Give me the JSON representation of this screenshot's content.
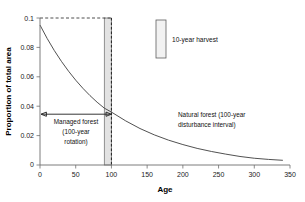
{
  "chart_data": {
    "type": "line",
    "title": "",
    "xlabel": "Age",
    "ylabel": "Proportion of total area",
    "xlim": [
      0,
      350
    ],
    "ylim": [
      0,
      0.1
    ],
    "grid": false,
    "x_ticks": [
      0,
      50,
      100,
      150,
      200,
      250,
      300,
      350
    ],
    "x_tick_labels": [
      "0",
      "50",
      "100",
      "150",
      "200",
      "250",
      "300",
      "350"
    ],
    "y_ticks": [
      0,
      0.02,
      0.04,
      0.06,
      0.08,
      0.1
    ],
    "y_tick_labels": [
      "0",
      "0.02",
      "0.04",
      "0.06",
      "0.08",
      "0.1"
    ],
    "series": [
      {
        "name": "Natural forest (100-year disturbance interval)",
        "type": "line",
        "x": [
          0,
          10,
          20,
          30,
          40,
          50,
          60,
          70,
          80,
          90,
          100,
          120,
          140,
          160,
          180,
          200,
          220,
          240,
          260,
          280,
          300,
          320,
          340
        ],
        "values": [
          0.0952,
          0.0861,
          0.0779,
          0.0705,
          0.0638,
          0.0577,
          0.0522,
          0.0472,
          0.0427,
          0.0387,
          0.036,
          0.03,
          0.0248,
          0.0205,
          0.0169,
          0.0139,
          0.0113,
          0.0092,
          0.0074,
          0.0058,
          0.0046,
          0.0038,
          0.0032
        ]
      },
      {
        "name": "Managed forest full-stocking reference",
        "type": "dashed-horizontal",
        "y": 0.1,
        "x_start": 0,
        "x_end": 100
      },
      {
        "name": "Rotation age marker",
        "type": "dashed-vertical",
        "x": 100,
        "y_start": 0,
        "y_end": 0.1
      }
    ],
    "shaded_regions": [
      {
        "name": "10-year harvest band",
        "x_start": 90,
        "x_end": 100,
        "y_start": 0,
        "y_end": 0.1,
        "fill": "#e2e2e2"
      }
    ],
    "annotations": [
      {
        "name": "managed-forest-span",
        "type": "double-arrow",
        "x_start": 0,
        "x_end": 100,
        "y": 0.0345,
        "label_lines": [
          "Managed forest",
          "(100-year",
          "rotation)"
        ]
      },
      {
        "name": "natural-forest-label",
        "type": "text",
        "x": 175,
        "y": 0.027,
        "label_lines": [
          "Natural forest (100-year",
          "disturbance interval)"
        ]
      }
    ],
    "legend": {
      "position": "inside-top-center",
      "entries": [
        {
          "label": "10-year harvest",
          "swatch": "tall-narrow-rectangle",
          "fill": "#f2f2f2",
          "stroke": "#5f5f5f"
        }
      ]
    },
    "colors": {
      "curve": "#3d3d3d",
      "axis": "#6e6e6e",
      "band_fill": "#e2e2e2",
      "text": "#111111"
    }
  },
  "figure": {
    "background": "#ffffff",
    "border": "#c9c9c9"
  }
}
